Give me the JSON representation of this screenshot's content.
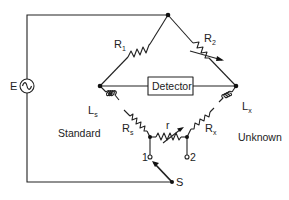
{
  "diagram": {
    "type": "circuit",
    "title": "",
    "source": {
      "label": "E",
      "symbol": "ac-source"
    },
    "detector": {
      "label": "Detector"
    },
    "components": {
      "R1": {
        "letter": "R",
        "sub": "1"
      },
      "R2": {
        "letter": "R",
        "sub": "2"
      },
      "Ls": {
        "letter": "L",
        "sub": "s"
      },
      "Lx": {
        "letter": "L",
        "sub": "x"
      },
      "Rs": {
        "letter": "R",
        "sub": "s"
      },
      "Rx": {
        "letter": "R",
        "sub": "x"
      },
      "r": {
        "letter": "r"
      }
    },
    "switch": {
      "label": "S",
      "terminals": [
        "1",
        "2"
      ]
    },
    "regions": {
      "left": "Standard",
      "right": "Unknown"
    }
  }
}
